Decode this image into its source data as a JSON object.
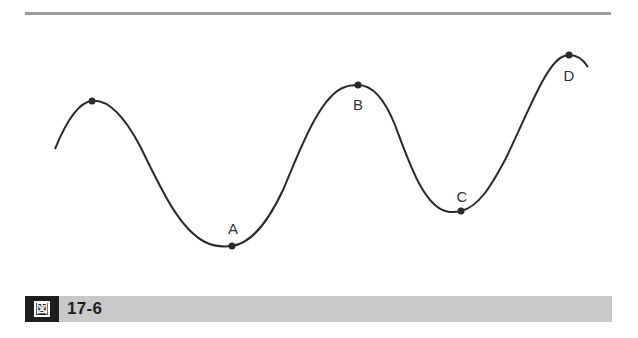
{
  "figure": {
    "caption_icon": "zu-kanji-icon",
    "caption_icon_glyph": "図",
    "caption_number": "17-6",
    "curve_color": "#2a2a2a",
    "rule_color": "#9a9a9a",
    "caption_bar_color": "#c9c9c9",
    "points": [
      {
        "id": "peak-unlabeled",
        "label": "",
        "x": 92,
        "y": 101
      },
      {
        "id": "A",
        "label": "A",
        "x": 232,
        "y": 246,
        "label_x": 233,
        "label_y": 234
      },
      {
        "id": "B",
        "label": "B",
        "x": 358,
        "y": 85,
        "label_x": 358,
        "label_y": 110
      },
      {
        "id": "C",
        "label": "C",
        "x": 461,
        "y": 211,
        "label_x": 462,
        "label_y": 202
      },
      {
        "id": "D",
        "label": "D",
        "x": 569,
        "y": 55,
        "label_x": 569,
        "label_y": 81
      }
    ]
  }
}
